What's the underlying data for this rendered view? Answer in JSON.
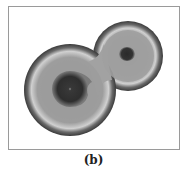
{
  "figure": {
    "caption": "(b)",
    "colors": {
      "background": "#ffffff",
      "frame": "#9a9a9a",
      "fill": "#9a9a9a",
      "rim": "#3a3a3a",
      "halo": "#cfcfcf",
      "core": "#2e2e2e"
    }
  }
}
